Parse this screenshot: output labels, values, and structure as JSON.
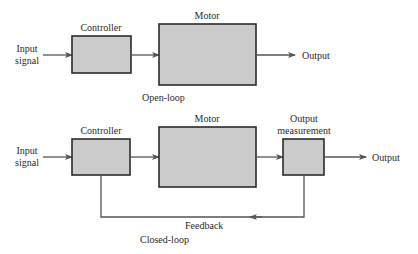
{
  "colors": {
    "box_fill": "#cbcbcb",
    "box_stroke": "#2b2b2b",
    "line": "#555555",
    "text": "#2a2a2a"
  },
  "open_loop": {
    "caption": "Open-loop",
    "input_label_line1": "Input",
    "input_label_line2": "signal",
    "blocks": [
      {
        "label": "Controller"
      },
      {
        "label": "Motor"
      }
    ],
    "output_label": "Output"
  },
  "closed_loop": {
    "caption": "Closed-loop",
    "input_label_line1": "Input",
    "input_label_line2": "signal",
    "blocks": [
      {
        "label": "Controller"
      },
      {
        "label": "Motor"
      },
      {
        "label_line1": "Output",
        "label_line2": "measurement"
      }
    ],
    "output_label": "Output",
    "feedback_label": "Feedback"
  }
}
